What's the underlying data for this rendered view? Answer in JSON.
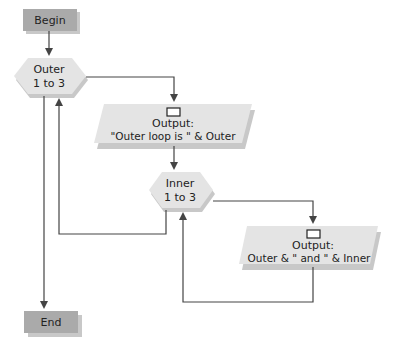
{
  "diagram": {
    "colors": {
      "terminal_fill": "#aaaaaa",
      "process_fill": "#e4e4e4",
      "line": "#444444",
      "shadow": "#c8c8c8"
    },
    "nodes": {
      "begin": {
        "label": "Begin"
      },
      "outer": {
        "line1": "Outer",
        "line2": "1 to 3"
      },
      "output1": {
        "line1": "Output:",
        "line2": "\"Outer loop is \" & Outer"
      },
      "inner": {
        "line1": "Inner",
        "line2": "1 to 3"
      },
      "output2": {
        "line1": "Output:",
        "line2": "Outer & \" and \" & Inner"
      },
      "end": {
        "label": "End"
      }
    },
    "edges": [
      {
        "from": "begin",
        "to": "outer"
      },
      {
        "from": "outer",
        "to": "output1",
        "label": ""
      },
      {
        "from": "output1",
        "to": "inner"
      },
      {
        "from": "inner",
        "to": "output2"
      },
      {
        "from": "output2",
        "to": "inner",
        "type": "loop-back"
      },
      {
        "from": "inner",
        "to": "outer",
        "type": "loop-back"
      },
      {
        "from": "outer",
        "to": "end",
        "type": "exit"
      }
    ]
  }
}
